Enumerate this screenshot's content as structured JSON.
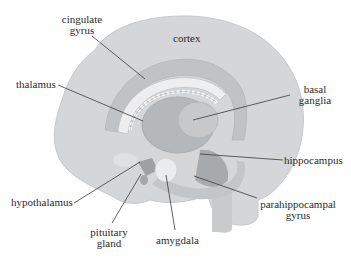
{
  "diagram": {
    "colors": {
      "background": "#ffffff",
      "cortex": "#d4d6d8",
      "cortex_edge": "#c4c6c8",
      "inner": "#c2c4c6",
      "structure_dark": "#a9acaf",
      "structure_mid": "#b8babd",
      "light": "#e3e4e5",
      "leader_line": "#3a3a3a"
    },
    "labels": {
      "cortex": "cortex",
      "cingulate_gyrus_1": "cingulate",
      "cingulate_gyrus_2": "gyrus",
      "thalamus": "thalamus",
      "basal_ganglia_1": "basal",
      "basal_ganglia_2": "ganglia",
      "hippocampus": "hippocampus",
      "hypothalamus": "hypothalamus",
      "parahippocampal_gyrus_1": "parahippocampal",
      "parahippocampal_gyrus_2": "gyrus",
      "pituitary_gland_1": "pituitary",
      "pituitary_gland_2": "gland",
      "amygdala": "amygdala"
    }
  }
}
